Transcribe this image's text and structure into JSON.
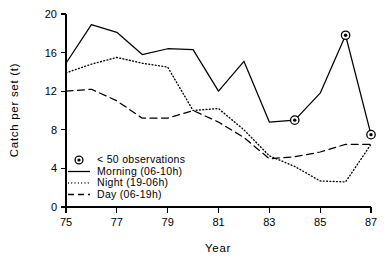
{
  "chart_data": {
    "type": "line",
    "title": "",
    "xlabel": "Year",
    "ylabel": "Catch per set (t)",
    "xlim": [
      75,
      87
    ],
    "ylim": [
      0,
      20
    ],
    "xticks": [
      75,
      77,
      79,
      81,
      83,
      85,
      87
    ],
    "yticks": [
      0,
      4,
      8,
      12,
      16,
      20
    ],
    "grid": false,
    "legend_position": "lower-left-inside",
    "x": [
      75,
      76,
      77,
      78,
      79,
      80,
      81,
      82,
      83,
      84,
      85,
      86,
      87
    ],
    "series": [
      {
        "name": "Morning (06-10h)",
        "style": "solid",
        "values": [
          14.9,
          18.9,
          18.1,
          15.8,
          16.4,
          16.3,
          12.0,
          15.1,
          8.8,
          9.0,
          11.8,
          17.8,
          7.5
        ]
      },
      {
        "name": "Night (19-06h)",
        "style": "dotted",
        "values": [
          13.9,
          14.8,
          15.5,
          14.9,
          14.5,
          10.0,
          10.2,
          8.0,
          5.3,
          4.2,
          2.7,
          2.6,
          6.5
        ]
      },
      {
        "name": "Day (06-19h)",
        "style": "dashed",
        "values": [
          12.0,
          12.2,
          11.0,
          9.2,
          9.2,
          10.0,
          8.8,
          7.2,
          5.0,
          5.2,
          5.7,
          6.5,
          6.5
        ]
      }
    ],
    "annotations": [
      {
        "label": "< 50 observations",
        "series": "Morning (06-10h)",
        "x": 84,
        "y": 9.0
      },
      {
        "label": "< 50 observations",
        "series": "Morning (06-10h)",
        "x": 86,
        "y": 17.8
      },
      {
        "label": "< 50 observations",
        "series": "Morning (06-10h)",
        "x": 87,
        "y": 7.5
      }
    ],
    "legend": [
      {
        "label": "< 50 observations",
        "sample": "marker"
      },
      {
        "label": "Morning (06-10h)",
        "sample": "solid"
      },
      {
        "label": "Night (19-06h)",
        "sample": "dotted"
      },
      {
        "label": "Day (06-19h)",
        "sample": "dashed"
      }
    ]
  }
}
